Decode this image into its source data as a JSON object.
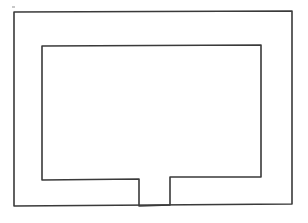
{
  "canvas": {
    "width": 308,
    "height": 223,
    "background_color": "#ffffff",
    "description": "Hand-drawn line diagram: two nested rectangles, inner rectangle open at the bottom center forming a notch/doorway gap"
  },
  "style": {
    "stroke_color": "#3a3a3a",
    "speck_color": "#c8c8c8",
    "outer_stroke_width": 1.6,
    "inner_stroke_width": 1.6
  },
  "shapes": {
    "outer_rectangle": {
      "name": "outer-rectangle",
      "points": "14,12 292,11 292,204 14,206 14,12",
      "left": 14,
      "top": 11,
      "right": 292,
      "bottom": 205
    },
    "inner_outline": {
      "name": "inner-outline-with-notch",
      "points": "42,46 261,45 261,177 170,177 170,205 139,206 139,179 42,180 42,46",
      "left": 42,
      "top": 45,
      "right": 261,
      "bottom": 179
    },
    "notch": {
      "name": "bottom-notch-gap",
      "left_wall_x": 139,
      "right_wall_x": 170,
      "top_y": 178,
      "bottom_y": 205,
      "width": 31
    },
    "speck": {
      "name": "stray-pencil-speck",
      "x": 12,
      "y": 6,
      "width": 3,
      "height": 2
    }
  }
}
